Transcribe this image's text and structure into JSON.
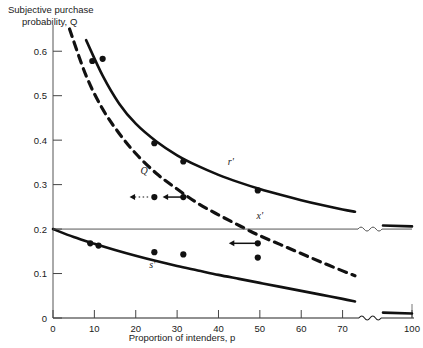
{
  "chart_data": {
    "type": "line",
    "title": "",
    "ylabel": "Subjective purchase probability, Q",
    "ylabel_line1": "Subjective purchase",
    "ylabel_line2": "probability, Q",
    "xlabel": "Proportion of intenders, p",
    "xlim": [
      0,
      100
    ],
    "ylim": [
      0,
      0.65
    ],
    "x_ticks": [
      0,
      10,
      20,
      30,
      40,
      50,
      60,
      70,
      100
    ],
    "x_tick_labels": [
      "0",
      "10",
      "20",
      "30",
      "40",
      "50",
      "60",
      "70",
      "100"
    ],
    "y_ticks": [
      0,
      0.1,
      0.2,
      0.3,
      0.4,
      0.5,
      0.6
    ],
    "y_tick_labels": [
      "0",
      "0.1",
      "0.2",
      "0.3",
      "0.4",
      "0.5",
      "0.6"
    ],
    "axis_break": {
      "from": 73,
      "to": 97,
      "style": "wavy"
    },
    "grid": false,
    "legend": "none",
    "series": [
      {
        "name": "Q",
        "label": "Q",
        "style": "dashed",
        "label_position": {
          "x": 22,
          "y": 0.325
        },
        "points": [
          {
            "x": 4,
            "y": 0.65
          },
          {
            "x": 8,
            "y": 0.545
          },
          {
            "x": 12,
            "y": 0.47
          },
          {
            "x": 16,
            "y": 0.415
          },
          {
            "x": 20,
            "y": 0.37
          },
          {
            "x": 25,
            "y": 0.325
          },
          {
            "x": 30,
            "y": 0.29
          },
          {
            "x": 35,
            "y": 0.258
          },
          {
            "x": 40,
            "y": 0.232
          },
          {
            "x": 45,
            "y": 0.208
          },
          {
            "x": 50,
            "y": 0.185
          },
          {
            "x": 55,
            "y": 0.165
          },
          {
            "x": 60,
            "y": 0.145
          },
          {
            "x": 65,
            "y": 0.125
          },
          {
            "x": 70,
            "y": 0.106
          },
          {
            "x": 73,
            "y": 0.095
          }
        ]
      },
      {
        "name": "r-prime",
        "label": "r'",
        "style": "solid",
        "label_position": {
          "x": 43,
          "y": 0.345
        },
        "points": [
          {
            "x": 8,
            "y": 0.625
          },
          {
            "x": 12,
            "y": 0.545
          },
          {
            "x": 16,
            "y": 0.482
          },
          {
            "x": 20,
            "y": 0.437
          },
          {
            "x": 25,
            "y": 0.397
          },
          {
            "x": 30,
            "y": 0.366
          },
          {
            "x": 35,
            "y": 0.342
          },
          {
            "x": 40,
            "y": 0.322
          },
          {
            "x": 45,
            "y": 0.305
          },
          {
            "x": 50,
            "y": 0.29
          },
          {
            "x": 55,
            "y": 0.277
          },
          {
            "x": 60,
            "y": 0.265
          },
          {
            "x": 65,
            "y": 0.254
          },
          {
            "x": 70,
            "y": 0.244
          },
          {
            "x": 73,
            "y": 0.239
          }
        ],
        "segment_right": [
          {
            "x": 97,
            "y": 0.208
          },
          {
            "x": 100,
            "y": 0.206
          }
        ]
      },
      {
        "name": "s-prime",
        "label": "s'",
        "style": "solid",
        "label_position": {
          "x": 24,
          "y": 0.113
        },
        "points": [
          {
            "x": 0,
            "y": 0.2
          },
          {
            "x": 5,
            "y": 0.182
          },
          {
            "x": 10,
            "y": 0.167
          },
          {
            "x": 15,
            "y": 0.153
          },
          {
            "x": 20,
            "y": 0.14
          },
          {
            "x": 25,
            "y": 0.128
          },
          {
            "x": 30,
            "y": 0.117
          },
          {
            "x": 35,
            "y": 0.107
          },
          {
            "x": 40,
            "y": 0.097
          },
          {
            "x": 45,
            "y": 0.088
          },
          {
            "x": 50,
            "y": 0.079
          },
          {
            "x": 55,
            "y": 0.07
          },
          {
            "x": 60,
            "y": 0.061
          },
          {
            "x": 65,
            "y": 0.052
          },
          {
            "x": 70,
            "y": 0.043
          },
          {
            "x": 73,
            "y": 0.037
          }
        ],
        "segment_right": [
          {
            "x": 97,
            "y": 0.012
          },
          {
            "x": 100,
            "y": 0.01
          }
        ]
      },
      {
        "name": "x-prime",
        "label": "x'",
        "style": "horizontal-thin",
        "label_position": {
          "x": 50,
          "y": 0.222
        },
        "y_value": 0.2,
        "points": [
          {
            "x": 0,
            "y": 0.2
          },
          {
            "x": 73,
            "y": 0.2
          }
        ],
        "segment_right": [
          {
            "x": 97,
            "y": 0.2
          },
          {
            "x": 100,
            "y": 0.2
          }
        ]
      }
    ],
    "scatter_points": [
      {
        "x": 9.5,
        "y": 0.578
      },
      {
        "x": 12.0,
        "y": 0.583
      },
      {
        "x": 24.5,
        "y": 0.393
      },
      {
        "x": 31.5,
        "y": 0.352
      },
      {
        "x": 49.5,
        "y": 0.287
      },
      {
        "x": 24.5,
        "y": 0.272
      },
      {
        "x": 31.5,
        "y": 0.272
      },
      {
        "x": 49.5,
        "y": 0.168
      },
      {
        "x": 49.5,
        "y": 0.136
      },
      {
        "x": 9.0,
        "y": 0.168
      },
      {
        "x": 11.0,
        "y": 0.163
      },
      {
        "x": 24.5,
        "y": 0.148
      },
      {
        "x": 31.5,
        "y": 0.143
      }
    ],
    "annotations": [
      {
        "type": "arrow",
        "name": "arrow-upper-solid",
        "from": {
          "x": 31.5,
          "y": 0.272
        },
        "to": {
          "x": 26.5,
          "y": 0.272
        },
        "style": "solid"
      },
      {
        "type": "arrow",
        "name": "arrow-upper-dotted",
        "from": {
          "x": 23.0,
          "y": 0.272
        },
        "to": {
          "x": 18.5,
          "y": 0.272
        },
        "style": "dotted"
      },
      {
        "type": "arrow",
        "name": "arrow-lower-solid",
        "from": {
          "x": 49.5,
          "y": 0.168
        },
        "to": {
          "x": 42.5,
          "y": 0.168
        },
        "style": "solid"
      }
    ]
  }
}
